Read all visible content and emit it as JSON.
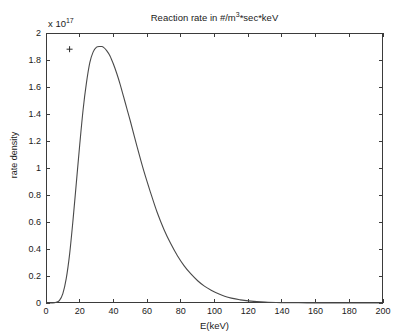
{
  "chart_data": {
    "type": "line",
    "title_parts": {
      "before": "Reaction rate in #/m",
      "exponent": "3",
      "after": "*sec*keV"
    },
    "xlabel": "E(keV)",
    "ylabel": "rate density",
    "exponent_label": {
      "prefix": "x 10",
      "exponent": "17"
    },
    "y_multiplier": 1e+17,
    "xlim": [
      0,
      200
    ],
    "ylim": [
      0,
      2
    ],
    "xticks": [
      0,
      20,
      40,
      60,
      80,
      100,
      120,
      140,
      160,
      180,
      200
    ],
    "xtick_labels": [
      "0",
      "20",
      "40",
      "60",
      "80",
      "100",
      "120",
      "140",
      "160",
      "180",
      "200"
    ],
    "yticks": [
      0,
      0.2,
      0.4,
      0.6,
      0.8,
      1,
      1.2,
      1.4,
      1.6,
      1.8,
      2
    ],
    "ytick_labels": [
      "0",
      "0.2",
      "0.4",
      "0.6",
      "0.8",
      "1",
      "1.2",
      "1.4",
      "1.6",
      "1.8",
      "2"
    ],
    "grid": false,
    "legend": null,
    "box": true,
    "tick_direction": "in",
    "series": [
      {
        "name": "rate density",
        "style": "solid-line",
        "color": "#4a4a4a",
        "x": [
          0,
          2,
          4,
          6,
          8,
          10,
          12,
          14,
          16,
          18,
          20,
          22,
          24,
          26,
          28,
          30,
          32,
          33,
          34,
          36,
          38,
          40,
          42,
          44,
          46,
          48,
          50,
          54,
          58,
          62,
          66,
          70,
          74,
          78,
          82,
          86,
          90,
          94,
          98,
          102,
          106,
          110,
          115,
          120,
          130,
          140,
          150,
          160,
          170,
          180,
          190,
          200
        ],
        "y": [
          0,
          0.0,
          0.0,
          0.005,
          0.02,
          0.07,
          0.18,
          0.36,
          0.61,
          0.89,
          1.17,
          1.43,
          1.63,
          1.78,
          1.86,
          1.895,
          1.9,
          1.9,
          1.895,
          1.87,
          1.83,
          1.77,
          1.7,
          1.62,
          1.53,
          1.44,
          1.35,
          1.16,
          0.98,
          0.82,
          0.67,
          0.545,
          0.44,
          0.35,
          0.275,
          0.215,
          0.165,
          0.125,
          0.095,
          0.07,
          0.05,
          0.036,
          0.024,
          0.016,
          0.007,
          0.003,
          0.0015,
          0.0008,
          0.0004,
          0.0002,
          0.0001,
          0.0
        ]
      }
    ],
    "annotations": [
      {
        "type": "marker",
        "glyph": "+",
        "x": 14,
        "y": 1.88,
        "name": "plus-marker"
      }
    ]
  }
}
